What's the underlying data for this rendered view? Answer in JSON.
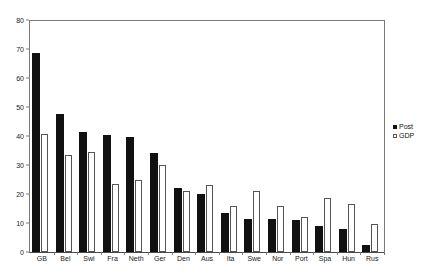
{
  "chart_data": {
    "type": "bar",
    "title": "",
    "subtitle": "",
    "xlabel": "",
    "ylabel": "",
    "ylim": [
      0,
      80
    ],
    "ytick_step": 10,
    "yticks": [
      0,
      10,
      20,
      30,
      40,
      50,
      60,
      70,
      80
    ],
    "grid": false,
    "legend_position": "right",
    "categories": [
      "GB",
      "Bel",
      "Swi",
      "Fra",
      "Neth",
      "Ger",
      "Den",
      "Aus",
      "Ita",
      "Swe",
      "Nor",
      "Port",
      "Spa",
      "Hun",
      "Rus"
    ],
    "series": [
      {
        "name": "Post",
        "color": "#111111",
        "values": [
          68.7,
          47.7,
          41.5,
          40.5,
          39.5,
          34.0,
          22.0,
          20.0,
          13.5,
          11.5,
          11.5,
          11.0,
          9.0,
          8.0,
          2.5
        ]
      },
      {
        "name": "GDP",
        "color": "#ffffff",
        "values": [
          40.8,
          33.3,
          34.4,
          23.5,
          25.0,
          30.0,
          21.0,
          23.0,
          16.0,
          21.0,
          16.0,
          12.0,
          18.5,
          16.5,
          9.5
        ]
      }
    ]
  },
  "legend": {
    "entries": [
      {
        "label": "Post",
        "swatch": "filled-square-icon"
      },
      {
        "label": "GDP",
        "swatch": "open-square-icon"
      }
    ]
  },
  "colors": {
    "post": "#111111",
    "gdp_fill": "#ffffff",
    "gdp_stroke": "#555555",
    "axis": "#7a7a7a",
    "text": "#1a1a1a",
    "background": "#ffffff"
  }
}
